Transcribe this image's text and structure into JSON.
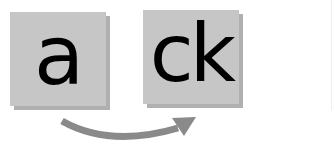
{
  "diagram": {
    "source_tile": {
      "text": "a"
    },
    "target_tile": {
      "text": "ck"
    },
    "arrow": {
      "direction": "from-left-to-right",
      "shape": "curved-under"
    },
    "colors": {
      "tile_fill": "#c6c6c6",
      "tile_shadow": "#b0b0b0",
      "text": "#000000",
      "arrow": "#8a8a8a"
    }
  }
}
